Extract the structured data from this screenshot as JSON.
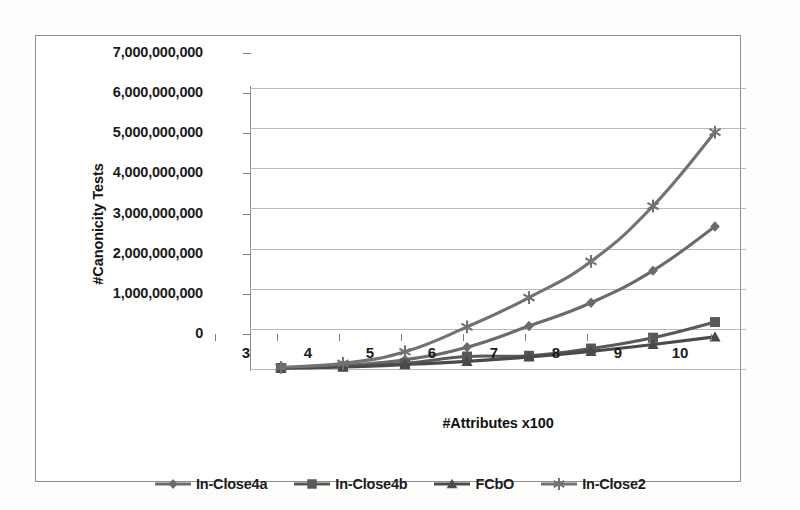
{
  "chart_data": {
    "type": "line",
    "title": "",
    "xlabel": "#Attributes x100",
    "ylabel": "#Canonicity Tests",
    "x": [
      3,
      4,
      5,
      6,
      7,
      8,
      9,
      10
    ],
    "xticklabels": [
      "3",
      "4",
      "5",
      "6",
      "7",
      "8",
      "9",
      "10"
    ],
    "yticklabels": [
      "7,000,000,000",
      "6,000,000,000",
      "5,000,000,000",
      "4,000,000,000",
      "3,000,000,000",
      "2,000,000,000",
      "1,000,000,000",
      "0"
    ],
    "ylim": [
      0,
      7000000000
    ],
    "ytick_values": [
      0,
      1000000000,
      2000000000,
      3000000000,
      4000000000,
      5000000000,
      6000000000,
      7000000000
    ],
    "grid": true,
    "legend_position": "bottom",
    "series": [
      {
        "name": "In-Close4a",
        "marker": "diamond",
        "color": "#6b6b6b",
        "values": [
          30000000,
          90000000,
          230000000,
          540000000,
          1070000000,
          1650000000,
          2450000000,
          3550000000
        ]
      },
      {
        "name": "In-Close4b",
        "marker": "square",
        "color": "#595959",
        "values": [
          25000000,
          60000000,
          140000000,
          310000000,
          330000000,
          510000000,
          780000000,
          1170000000
        ]
      },
      {
        "name": "FCbO",
        "marker": "triangle",
        "color": "#4a4a4a",
        "values": [
          20000000,
          50000000,
          110000000,
          190000000,
          300000000,
          440000000,
          610000000,
          800000000
        ]
      },
      {
        "name": "In-Close2",
        "marker": "asterisk",
        "color": "#727272",
        "values": [
          40000000,
          140000000,
          430000000,
          1050000000,
          1780000000,
          2680000000,
          4060000000,
          5900000000
        ]
      }
    ]
  }
}
